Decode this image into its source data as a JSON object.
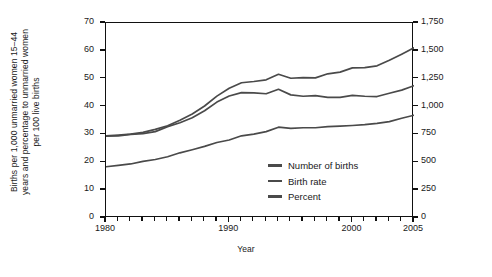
{
  "chart_data": {
    "type": "line",
    "title": "",
    "xlabel": "Year",
    "ylabel": "Births per 1,000 unmarried women 15–44 years and percentage to unmarried women per 100 live births",
    "ylabel_right": "Births in thousands",
    "xlim": [
      1980,
      2005
    ],
    "ylim": [
      0,
      70
    ],
    "ylim_right": [
      0,
      1750
    ],
    "grid": false,
    "legend_position": "inside-right",
    "xticks": [
      1980,
      1990,
      2000,
      2005
    ],
    "xticks_minor_step": 1,
    "yticks": [
      0,
      10,
      20,
      30,
      40,
      50,
      60,
      70
    ],
    "yticks_right": [
      0,
      250,
      500,
      750,
      1000,
      1250,
      1500,
      1750
    ],
    "ytick_labels_right": [
      "0",
      "250",
      "500",
      "750",
      "1,000",
      "1,250",
      "1,500",
      "1,750"
    ],
    "line_color": "#4a4a4a",
    "x": [
      1980,
      1981,
      1982,
      1983,
      1984,
      1985,
      1986,
      1987,
      1988,
      1989,
      1990,
      1991,
      1992,
      1993,
      1994,
      1995,
      1996,
      1997,
      1998,
      1999,
      2000,
      2001,
      2002,
      2003,
      2004,
      2005
    ],
    "series": [
      {
        "name": "Number of births",
        "axis": "right",
        "unit": "thousands",
        "values": [
          738,
          744,
          752,
          768,
          795,
          828,
          878,
          934,
          1005,
          1094,
          1165,
          1214,
          1225,
          1240,
          1290,
          1254,
          1260,
          1257,
          1294,
          1309,
          1347,
          1349,
          1366,
          1416,
          1470,
          1527
        ]
      },
      {
        "name": "Birth rate",
        "axis": "left",
        "unit": "births per 1,000 unmarried women 15-44",
        "values": [
          29.4,
          29.5,
          30.0,
          30.3,
          31.0,
          32.8,
          34.2,
          36.0,
          38.5,
          41.6,
          43.8,
          45.0,
          44.9,
          44.6,
          46.2,
          44.2,
          43.7,
          43.9,
          43.3,
          43.3,
          44.0,
          43.7,
          43.6,
          44.8,
          45.9,
          47.5
        ]
      },
      {
        "name": "Percent",
        "axis": "left",
        "unit": "percent of live births to unmarried women",
        "values": [
          18.4,
          18.9,
          19.4,
          20.3,
          21.0,
          22.0,
          23.4,
          24.5,
          25.7,
          27.1,
          28.0,
          29.5,
          30.1,
          31.0,
          32.6,
          32.2,
          32.4,
          32.4,
          32.8,
          33.0,
          33.2,
          33.5,
          34.0,
          34.6,
          35.8,
          36.9
        ]
      }
    ]
  },
  "legend": {
    "items": [
      {
        "label": "Number of births"
      },
      {
        "label": "Birth rate"
      },
      {
        "label": "Percent"
      }
    ]
  },
  "axis_titles": {
    "left_line1": "Births per 1,000 unmarried women 15–44",
    "left_line2": "years and percentage to unmarried women",
    "left_line3": "per 100 live births",
    "right": "Births in thousands",
    "bottom": "Year"
  }
}
